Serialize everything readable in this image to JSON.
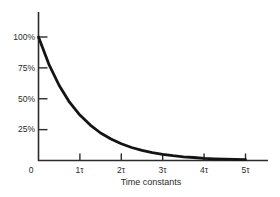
{
  "chart_data": {
    "type": "line",
    "title": "",
    "xlabel": "Time constants",
    "ylabel": "",
    "x_tick_labels": [
      "0",
      "1τ",
      "2τ",
      "3τ",
      "4τ",
      "5τ"
    ],
    "y_tick_labels": [
      "100%",
      "75%",
      "50%",
      "25%"
    ],
    "x_tick_values": [
      0,
      1,
      2,
      3,
      4,
      5
    ],
    "y_tick_values": [
      100,
      75,
      50,
      25
    ],
    "xlim": [
      0,
      5.55
    ],
    "ylim": [
      0,
      120
    ],
    "grid": false,
    "legend": "none",
    "series": [
      {
        "name": "exponential-decay",
        "x": [
          0,
          0.25,
          0.5,
          0.75,
          1,
          1.25,
          1.5,
          1.75,
          2,
          2.25,
          2.5,
          2.75,
          3,
          3.25,
          3.5,
          3.75,
          4,
          4.25,
          4.5,
          4.75,
          5
        ],
        "y": [
          100,
          77.9,
          60.7,
          47.2,
          36.8,
          28.7,
          22.3,
          17.4,
          13.5,
          10.5,
          8.2,
          6.4,
          5.0,
          3.9,
          3.0,
          2.4,
          1.8,
          1.4,
          1.1,
          0.9,
          0.7
        ]
      }
    ],
    "colors": {
      "curve": "#141414",
      "axis": "#2b2b2b",
      "text": "#2a2a2a",
      "background": "#ffffff"
    }
  }
}
